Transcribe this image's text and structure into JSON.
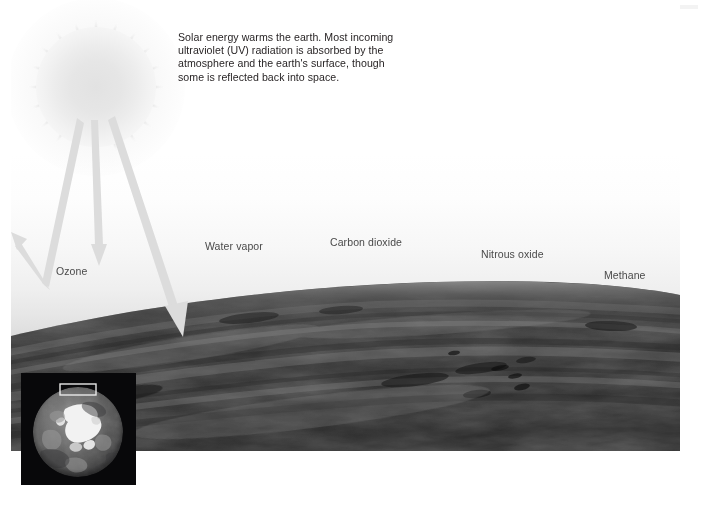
{
  "figure": {
    "caption_lines": [
      "Solar energy warms the earth. Most incoming",
      "ultraviolet (UV) radiation is absorbed by the",
      "atmosphere and the earth's surface, though",
      "some is reflected back into space."
    ],
    "caption_text": "Solar energy warms the earth. Most incoming ultraviolet (UV) radiation is absorbed by the atmosphere and the earth's surface, though some is reflected back into space.",
    "gas_labels": [
      {
        "name": "ozone",
        "label": "Ozone",
        "x": 56,
        "y": 271
      },
      {
        "name": "water-vapor",
        "label": "Water vapor",
        "x": 205,
        "y": 246
      },
      {
        "name": "carbon-dioxide",
        "label": "Carbon dioxide",
        "x": 330,
        "y": 242
      },
      {
        "name": "nitrous-oxide",
        "label": "Nitrous oxide",
        "x": 481,
        "y": 254
      },
      {
        "name": "methane",
        "label": "Methane",
        "x": 604,
        "y": 275
      }
    ],
    "arrows": [
      {
        "name": "incoming-reflected-ray",
        "description": "incoming solar ray reflected back into space"
      },
      {
        "name": "absorbed-atmosphere-ray",
        "description": "ray absorbed by the atmosphere"
      },
      {
        "name": "surface-absorbed-ray",
        "description": "ray reaching and absorbed by the earth's surface"
      }
    ],
    "sun": {
      "name": "sun",
      "label": ""
    },
    "inset": {
      "name": "globe-inset",
      "description": "grayscale satellite view of the earth with highlight box at the top limb",
      "highlight_box": "region shown in main illustration"
    },
    "colors": {
      "ray": "#dcdcdc",
      "sun": "#e6e6e6",
      "label_text": "#4a4a4a",
      "caption_text": "#231f20",
      "atmosphere_haze": "#dedede",
      "surface_dark": "#2c2c2c",
      "background": "#ffffff"
    }
  }
}
